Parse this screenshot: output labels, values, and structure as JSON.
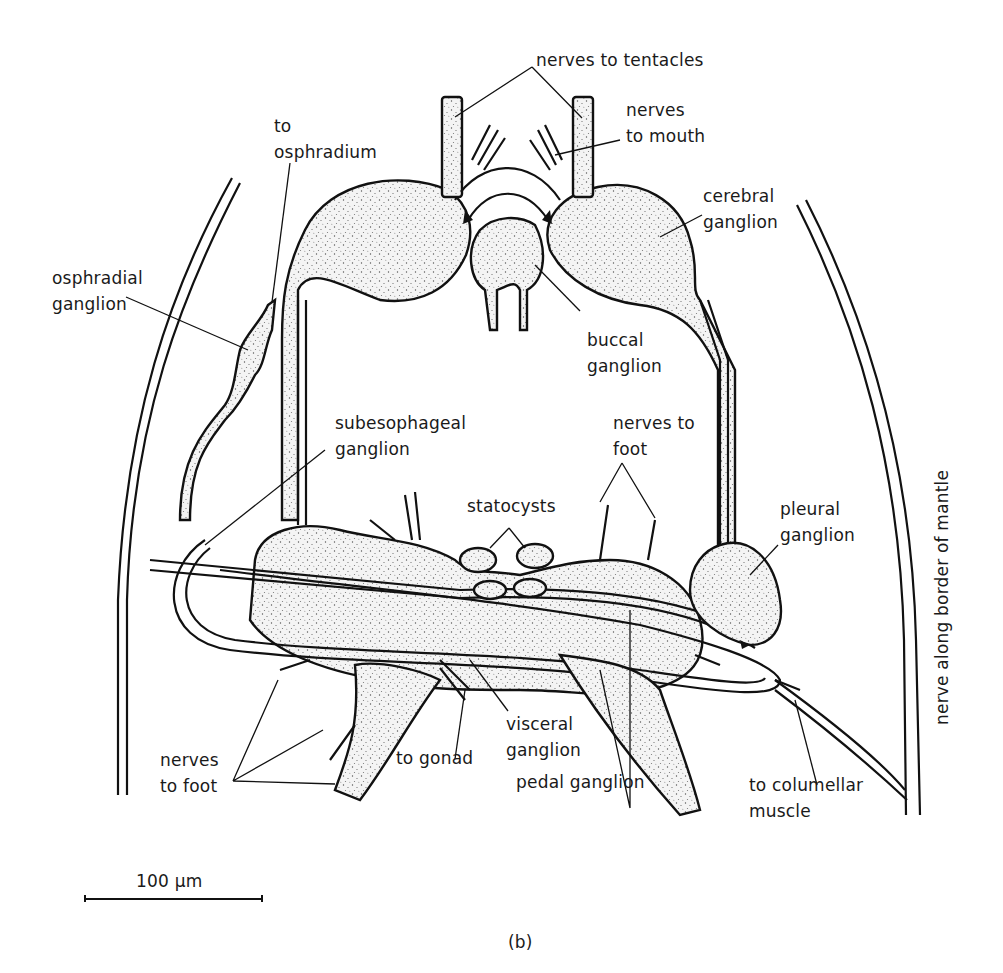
{
  "figure": {
    "panel_label": "(b)",
    "scale_bar": {
      "label": "100 μm"
    },
    "labels": {
      "nerves_to_tentacles": "nerves to tentacles",
      "to_osphradium": "to\nosphradium",
      "nerves_to_mouth": "nerves\nto mouth",
      "cerebral_ganglion": "cerebral\nganglion",
      "osphradial_ganglion": "osphradial\nganglion",
      "buccal_ganglion": "buccal\nganglion",
      "subesophageal_ganglion": "subesophageal\nganglion",
      "nerves_to_foot_upper": "nerves to\nfoot",
      "statocysts": "statocysts",
      "pleural_ganglion": "pleural\nganglion",
      "nerve_along_border_of_mantle": "nerve along border of mantle",
      "nerves_to_foot_lower": "nerves\nto foot",
      "to_gonad": "to gonad",
      "visceral_ganglion": "visceral\nganglion",
      "pedal_ganglion": "pedal ganglion",
      "to_columellar_muscle": "to columellar\nmuscle"
    }
  }
}
